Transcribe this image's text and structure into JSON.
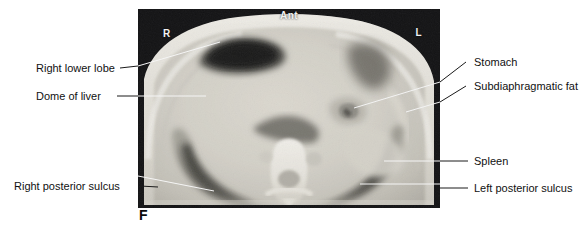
{
  "figure": {
    "letter": "F",
    "modality": "axial CT scan of the upper abdomen and lung bases"
  },
  "scan": {
    "orientation_markers": [
      {
        "name": "right-marker",
        "text": "R"
      },
      {
        "name": "left-marker",
        "text": "L"
      },
      {
        "name": "anterior-marker",
        "text": "Ant"
      }
    ],
    "background_color": "#101010",
    "soft_tissue_color": "#d8d5cc",
    "bone_color": "#f4f2ec",
    "lung_color": "#3a3a38"
  },
  "annotations": {
    "left": [
      {
        "name": "right-lower-lobe",
        "label": "Right lower lobe"
      },
      {
        "name": "dome-of-liver",
        "label": "Dome of liver"
      },
      {
        "name": "right-posterior-sulcus",
        "label": "Right posterior sulcus"
      }
    ],
    "right": [
      {
        "name": "stomach",
        "label": "Stomach"
      },
      {
        "name": "subdiaphragmatic-fat",
        "label": "Subdiaphragmatic fat"
      },
      {
        "name": "spleen",
        "label": "Spleen"
      },
      {
        "name": "left-posterior-sulcus",
        "label": "Left posterior sulcus"
      }
    ]
  },
  "leader_line_color": "#1a1a1a",
  "in_image_leader_color": "#f5f5f5"
}
